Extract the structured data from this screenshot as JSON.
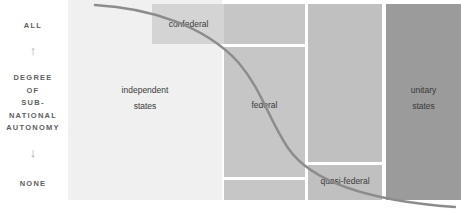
{
  "axis": {
    "top_label": "ALL",
    "bottom_label": "NONE",
    "middle_label": "DEGREE\nOF\nSUB-\nNATIONAL\nAUTONOMY",
    "up_arrow": "↑",
    "down_arrow": "↓"
  },
  "colors": {
    "independent": "#f0f0f0",
    "confederal": "#d4d4d4",
    "federal": "#c6c6c6",
    "quasi": "#c0c0c0",
    "unitary": "#9b9b9b",
    "curve": "#8c8c8c",
    "divider": "#ffffff",
    "text": "#3a3a3a",
    "axis_text": "#5e5e5e",
    "background": "#ffffff"
  },
  "blocks": {
    "independent": "independent\nstates",
    "independent_line1": "independent",
    "independent_line2": "states",
    "confederal": "confederal",
    "federal": "federal",
    "quasi_federal": "quasi-federal",
    "unitary_line1": "unitary",
    "unitary_line2": "states"
  },
  "chart_data": {
    "type": "area",
    "title": "",
    "ylabel": "DEGREE OF SUB-NATIONAL AUTONOMY",
    "xlabel": "",
    "ylim_labels": [
      "NONE",
      "ALL"
    ],
    "grid": false,
    "legend": "none",
    "categories": [
      "independent states",
      "confederal",
      "federal",
      "quasi-federal",
      "unitary states"
    ],
    "annotations": [
      "descending S-curve from high autonomy (left) to low autonomy (right)"
    ],
    "series": [
      {
        "name": "sub-national autonomy",
        "x": [
          0,
          12,
          25,
          38,
          50,
          62,
          75,
          88,
          100
        ],
        "values": [
          98,
          93,
          84,
          70,
          50,
          30,
          16,
          8,
          3
        ]
      }
    ]
  }
}
